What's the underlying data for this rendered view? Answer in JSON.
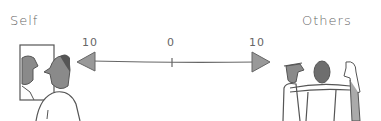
{
  "diagram": {
    "left_label": "Self",
    "right_label": "Others",
    "scale": {
      "left_value": "10",
      "center_value": "0",
      "right_value": "10"
    },
    "left_illustration": "person-looking-in-mirror",
    "right_illustration": "group-of-three-people-embracing",
    "colors": {
      "line": "#666666",
      "arrowhead_fill": "#999999",
      "figure_fill": "#8a8a8a"
    }
  }
}
